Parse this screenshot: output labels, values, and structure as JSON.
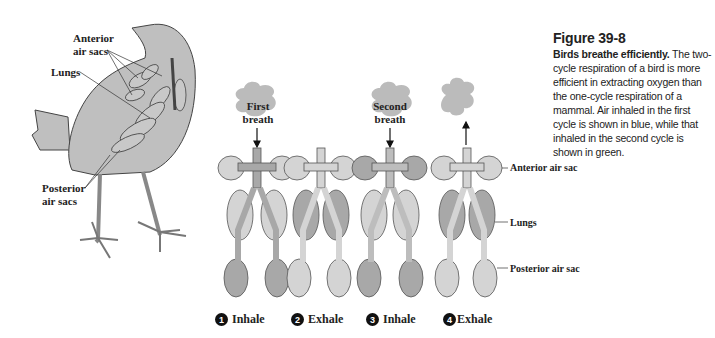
{
  "caption": {
    "figure_number": "Figure 39-8",
    "lead": "Birds breathe efficiently.",
    "body": " The two-cycle respiration of a bird is more efficient in extracting oxygen than the one-cycle respiration of a mammal. Air inhaled in the first cycle is shown in blue, while that inhaled in the second cycle is shown in green."
  },
  "bird": {
    "labels": {
      "anterior": "Anterior\nair sacs",
      "anterior_line1": "Anterior",
      "anterior_line2": "air sacs",
      "lungs": "Lungs",
      "posterior_line1": "Posterior",
      "posterior_line2": "air sacs"
    }
  },
  "cycle": {
    "breaths": {
      "first_line1": "First",
      "first_line2": "breath",
      "second_line1": "Second",
      "second_line2": "breath"
    },
    "steps": [
      {
        "number": "1",
        "label": "Inhale"
      },
      {
        "number": "2",
        "label": "Exhale"
      },
      {
        "number": "3",
        "label": "Inhale"
      },
      {
        "number": "4",
        "label": "Exhale"
      }
    ],
    "side_labels": {
      "anterior": "Anterior air sac",
      "lungs": "Lungs",
      "posterior": "Posterior air sac"
    }
  },
  "colors": {
    "light_fill": "#d4d4d4",
    "dark_fill": "#a8a8a8",
    "mid_fill": "#bdbdbd",
    "outline": "#555555",
    "puff": "#bbbbbb"
  }
}
